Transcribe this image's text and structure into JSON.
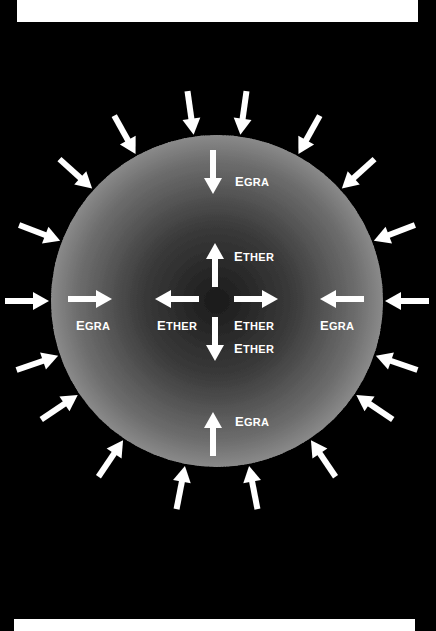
{
  "header": {
    "text_cut_off": ""
  },
  "diagram": {
    "title": "",
    "colors": {
      "background": "#000000",
      "sphere": "#8a8a8a",
      "arrow": "#ffffff",
      "label": "#ffffff",
      "frame_bar": "#ffffff"
    },
    "sphere": {
      "cx": 217,
      "cy": 301,
      "r": 166
    },
    "outer_arrow_count": 16,
    "labels": {
      "egra_top": {
        "first": "E",
        "rest": "GRA"
      },
      "egra_left": {
        "first": "E",
        "rest": "GRA"
      },
      "egra_right": {
        "first": "E",
        "rest": "GRA"
      },
      "egra_bottom": {
        "first": "E",
        "rest": "GRA"
      },
      "ether_up": {
        "first": "E",
        "rest": "THER"
      },
      "ether_left": {
        "first": "E",
        "rest": "THER"
      },
      "ether_right": {
        "first": "E",
        "rest": "THER"
      },
      "ether_down": {
        "first": "E",
        "rest": "THER"
      }
    }
  }
}
